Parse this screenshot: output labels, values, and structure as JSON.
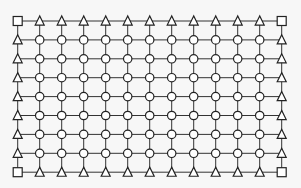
{
  "diagram": {
    "type": "grid-mesh",
    "columns": 13,
    "rows": 9,
    "origin": {
      "x": 17.7,
      "y": 21
    },
    "spacing": {
      "x": 22.0,
      "y": 18.9
    },
    "node_types": {
      "corner": "square",
      "edge": "triangle",
      "interior": "circle"
    },
    "colors": {
      "background": "#f7f7f7",
      "line": "#333333",
      "node_fill": "#ffffff",
      "node_stroke": "#222222"
    },
    "sizes": {
      "square": 9,
      "triangle": 9,
      "circle_r": 4.2
    }
  }
}
